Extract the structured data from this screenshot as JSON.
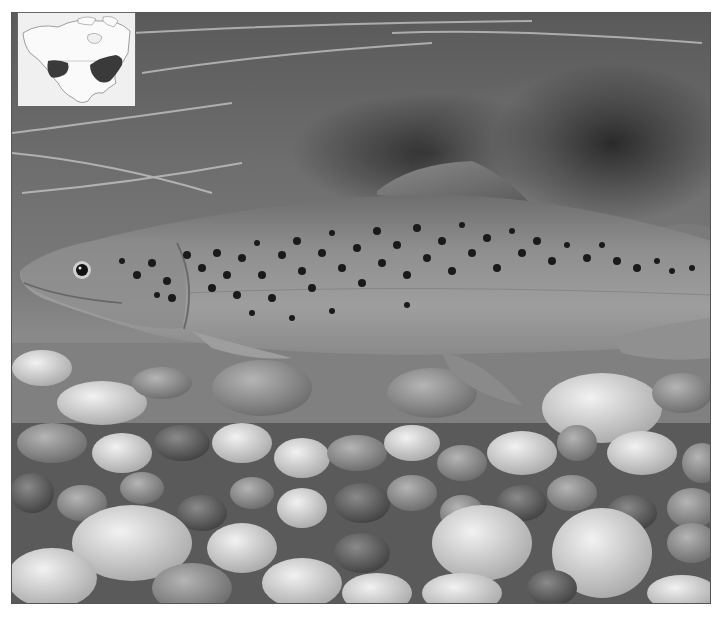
{
  "image": {
    "subject": "Brown trout swimming over river gravel",
    "description": "Black-and-white photograph of a spotted brown trout facing left above a bed of rounded river stones",
    "tones": {
      "background_dark": "#2a2a2a",
      "background_mid": "#6d6d6d",
      "fish_body": "#8c8c8c",
      "fish_belly": "#a6a6a6",
      "spots": "#1a1a1a",
      "rocks_light": "#d8d8d8",
      "rocks_mid": "#9a9a9a",
      "rocks_dark": "#3a3a3a"
    }
  },
  "inset_map": {
    "label": "range-map",
    "region": "North America",
    "shaded_areas": [
      "western range",
      "eastern range"
    ],
    "map_background": "#f0f0f0",
    "shade_color": "#3a3a3a"
  }
}
